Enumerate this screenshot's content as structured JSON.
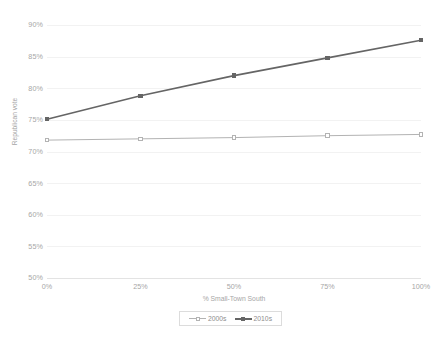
{
  "chart_data": {
    "type": "line",
    "title": "",
    "xlabel": "% Small-Town South",
    "ylabel": "Republican vote",
    "x": [
      0,
      25,
      50,
      75,
      100
    ],
    "xtick_labels": [
      "0%",
      "25%",
      "50%",
      "75%",
      "100%"
    ],
    "ytick_labels": [
      "90%",
      "85%",
      "80%",
      "75%",
      "70%",
      "65%",
      "60%",
      "55%",
      "50%"
    ],
    "ytick_values": [
      90,
      85,
      80,
      75,
      70,
      65,
      60,
      55,
      50
    ],
    "ylim": [
      50,
      90
    ],
    "xlim": [
      0,
      100
    ],
    "grid": true,
    "legend_position": "bottom",
    "series": [
      {
        "name": "2000s",
        "color": "#b3b3b3",
        "marker": "square-open",
        "values": [
          71.8,
          72.0,
          72.2,
          72.5,
          72.7
        ]
      },
      {
        "name": "2010s",
        "color": "#656565",
        "marker": "square-filled",
        "values": [
          75.1,
          78.8,
          82.0,
          84.8,
          87.6
        ]
      }
    ]
  },
  "axes": {
    "y_title": "Republican vote",
    "x_title": "% Small-Town South"
  },
  "legend": {
    "items": [
      {
        "label": "2000s"
      },
      {
        "label": "2010s"
      }
    ]
  },
  "colors": {
    "series_2000s": "#b3b3b3",
    "series_2010s": "#656565",
    "gridline": "#f2f2f2",
    "axis": "#e3e3e3",
    "tick_text": "#a6a6a6",
    "background": "#ffffff"
  },
  "caption": {
    "partial_text": ""
  }
}
